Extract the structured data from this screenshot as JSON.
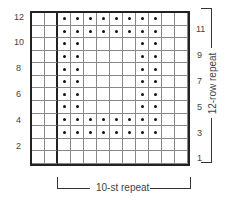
{
  "chart_data": {
    "type": "knitting-chart",
    "columns": 12,
    "rows": 12,
    "left_row_labels": [
      "12",
      "10",
      "8",
      "6",
      "4",
      "2"
    ],
    "right_row_labels": [
      "11",
      "9",
      "7",
      "5",
      "3",
      "1"
    ],
    "pattern_rows_top_to_bottom": [
      "..########..",
      "..########..",
      "..##....##..",
      "..##....##..",
      "..##....##..",
      "..##....##..",
      "..##....##..",
      "..##....##..",
      "..########..",
      "..########..",
      "............",
      "............"
    ],
    "repeat_width_label": "10-st repeat",
    "repeat_height_label": "12-row repeat"
  }
}
